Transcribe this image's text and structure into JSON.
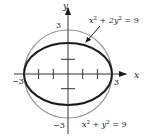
{
  "diagram": {
    "center": {
      "x": 68,
      "y": 74
    },
    "unit_px": 14.7,
    "colors": {
      "ellipse": "#1a1a1a",
      "circle": "#9a9a9a",
      "axis": "#333333",
      "text": "#222222"
    },
    "axes": {
      "x_label": "x",
      "y_label": "y"
    },
    "tick_labels": {
      "x_neg": "−3",
      "x_pos": "3",
      "y_pos": "3",
      "y_neg": "−3"
    },
    "curves": [
      {
        "name": "ellipse",
        "equation": "x² + 2y² = 9",
        "a": 3,
        "b": 2.121
      },
      {
        "name": "circle",
        "equation": "x² + y² = 9",
        "r": 3
      }
    ],
    "ellipse_label": {
      "base": "x",
      "sup1": "2",
      "mid": " + 2y",
      "sup2": "2",
      "rhs": " = 9"
    },
    "circle_label": {
      "base": "x",
      "sup1": "2",
      "mid": " + y",
      "sup2": "2",
      "rhs": " = 9"
    }
  }
}
